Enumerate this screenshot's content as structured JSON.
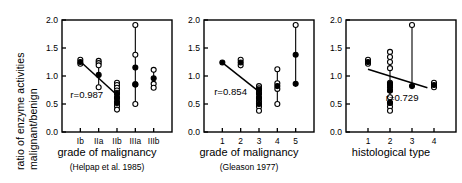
{
  "figure": {
    "ylabel_line1": "ratio of enzyme activities",
    "ylabel_line2": "malignant/benign",
    "axis_color": "#000000",
    "marker_color": "#000000",
    "background": "#ffffff"
  },
  "chart_data": [
    {
      "type": "scatter",
      "title": "",
      "xlabel": "grade of malignancy",
      "xsublabel": "(Helpap et al. 1985)",
      "ylabel": "ratio of enzyme activities malignant/benign",
      "ylim": [
        0.0,
        2.0
      ],
      "yticks": [
        0.0,
        0.5,
        1.0,
        1.5,
        2.0
      ],
      "ytick_labels": [
        "0.0",
        "0.5",
        "1.0",
        "1.5",
        "2.0"
      ],
      "grid": false,
      "categories": [
        "Ib",
        "IIa",
        "IIb",
        "IIIa",
        "IIIb"
      ],
      "annotation": "r=0.987",
      "annotation_x": 1.35,
      "annotation_y": 0.6,
      "regression": {
        "x0": 1.0,
        "y0": 1.26,
        "x1": 3.0,
        "y1": 0.66
      },
      "groups": [
        {
          "category": "Ib",
          "x": 1,
          "mean": 1.25,
          "whisker_low": 1.22,
          "whisker_high": 1.29,
          "open_points": [
            1.22,
            1.29
          ],
          "filled_points": [
            1.25
          ]
        },
        {
          "category": "IIa",
          "x": 2,
          "mean": 1.02,
          "whisker_low": 0.8,
          "whisker_high": 1.27,
          "open_points": [
            1.27,
            1.23,
            1.19,
            0.8
          ],
          "filled_points": [
            1.02
          ]
        },
        {
          "category": "IIb",
          "x": 3,
          "mean": 0.68,
          "whisker_low": 0.4,
          "whisker_high": 0.88,
          "open_points": [
            0.88,
            0.84,
            0.79,
            0.74,
            0.7,
            0.62,
            0.54,
            0.5,
            0.46,
            0.4
          ],
          "filled_points": [
            0.68,
            0.6,
            0.52
          ]
        },
        {
          "category": "IIIa",
          "x": 4,
          "mean": 1.15,
          "whisker_low": 0.5,
          "whisker_high": 1.91,
          "open_points": [
            1.91,
            1.38,
            0.85,
            0.5
          ],
          "filled_points": [
            1.15,
            0.85
          ]
        },
        {
          "category": "IIIb",
          "x": 5,
          "mean": 0.96,
          "whisker_low": 0.79,
          "whisker_high": 1.11,
          "open_points": [
            1.11,
            0.86,
            0.79
          ],
          "filled_points": [
            0.96
          ]
        }
      ]
    },
    {
      "type": "scatter",
      "title": "",
      "xlabel": "grade of malignancy",
      "xsublabel": "(Gleason 1977)",
      "ylabel": "",
      "ylim": [
        0.0,
        2.0
      ],
      "yticks": [
        0.0,
        0.5,
        1.0,
        1.5,
        2.0
      ],
      "ytick_labels": [
        "0.0",
        "0.5",
        "1.0",
        "1.5",
        "2.0"
      ],
      "grid": false,
      "categories": [
        "1",
        "2",
        "3",
        "4",
        "5"
      ],
      "annotation": "r=0.854",
      "annotation_x": 1.45,
      "annotation_y": 0.66,
      "regression": {
        "x0": 1.0,
        "y0": 1.24,
        "x1": 3.0,
        "y1": 0.72
      },
      "groups": [
        {
          "category": "1",
          "x": 1,
          "mean": 1.24,
          "whisker_low": 1.24,
          "whisker_high": 1.24,
          "open_points": [],
          "filled_points": [
            1.24
          ]
        },
        {
          "category": "2",
          "x": 2,
          "mean": 1.24,
          "whisker_low": 1.19,
          "whisker_high": 1.29,
          "open_points": [
            1.29,
            1.19
          ],
          "filled_points": [
            1.24
          ]
        },
        {
          "category": "3",
          "x": 3,
          "mean": 0.7,
          "whisker_low": 0.38,
          "whisker_high": 0.82,
          "open_points": [
            0.82,
            0.78,
            0.74,
            0.7,
            0.62,
            0.55,
            0.5,
            0.45,
            0.38
          ],
          "filled_points": [
            0.76,
            0.68,
            0.6,
            0.5
          ]
        },
        {
          "category": "4",
          "x": 4,
          "mean": 0.82,
          "whisker_low": 0.5,
          "whisker_high": 1.12,
          "open_points": [
            1.12,
            0.87,
            0.77,
            0.5
          ],
          "filled_points": [
            0.82
          ]
        },
        {
          "category": "5",
          "x": 5,
          "mean": 1.38,
          "whisker_low": 0.86,
          "whisker_high": 1.91,
          "open_points": [
            1.91
          ],
          "filled_points": [
            1.38,
            0.86
          ]
        }
      ]
    },
    {
      "type": "scatter",
      "title": "",
      "xlabel": "histological type",
      "xsublabel": "",
      "ylabel": "",
      "ylim": [
        0.0,
        2.0
      ],
      "yticks": [
        0.0,
        0.5,
        1.0,
        1.5,
        2.0
      ],
      "ytick_labels": [
        "0.0",
        "0.5",
        "1.0",
        "1.5",
        "2.0"
      ],
      "grid": false,
      "categories": [
        "1",
        "2",
        "3",
        "4"
      ],
      "annotation": "r=0.729",
      "annotation_x": 2.55,
      "annotation_y": 0.56,
      "regression": {
        "x0": 1.0,
        "y0": 1.12,
        "x1": 3.7,
        "y1": 0.79
      },
      "groups": [
        {
          "category": "1",
          "x": 1,
          "mean": 1.25,
          "whisker_low": 1.22,
          "whisker_high": 1.29,
          "open_points": [
            1.29,
            1.22
          ],
          "filled_points": [
            1.25
          ]
        },
        {
          "category": "2",
          "x": 2,
          "mean": 0.8,
          "whisker_low": 0.38,
          "whisker_high": 1.43,
          "open_points": [
            1.43,
            1.34,
            1.25,
            1.14,
            0.88,
            0.84,
            0.74,
            0.62,
            0.52,
            0.45,
            0.38
          ],
          "filled_points": [
            0.86,
            0.8,
            0.74,
            0.52
          ]
        },
        {
          "category": "3",
          "x": 3,
          "mean": 0.82,
          "whisker_low": 0.82,
          "whisker_high": 1.91,
          "open_points": [
            1.91
          ],
          "filled_points": [
            0.82
          ]
        },
        {
          "category": "4",
          "x": 4,
          "mean": 0.84,
          "whisker_low": 0.8,
          "whisker_high": 0.88,
          "open_points": [
            0.88,
            0.8
          ],
          "filled_points": [
            0.84
          ]
        }
      ]
    }
  ]
}
